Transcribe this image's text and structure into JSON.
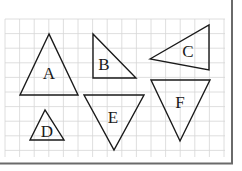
{
  "diagram": {
    "type": "triangles-on-grid",
    "grid": {
      "x0": 5,
      "y0": 19,
      "x1": 225,
      "y1": 157,
      "cell": 14.6,
      "color": "#d4d4d4"
    },
    "frame": {
      "color": "#6a6a6a"
    },
    "triangles": [
      {
        "label": "A",
        "points": "49,34 20,95 78,95",
        "lx": 49,
        "ly": 79
      },
      {
        "label": "B",
        "points": "93,34 93,78 136,78",
        "lx": 104,
        "ly": 70
      },
      {
        "label": "C",
        "points": "150,59 209,25 209,70",
        "lx": 188,
        "ly": 57
      },
      {
        "label": "D",
        "points": "45,110 30,140 64,140",
        "lx": 47,
        "ly": 137
      },
      {
        "label": "E",
        "points": "84,95 144,95 114,150",
        "lx": 113,
        "ly": 123
      },
      {
        "label": "F",
        "points": "151,80 210,80 180,141",
        "lx": 180,
        "ly": 108
      }
    ]
  }
}
